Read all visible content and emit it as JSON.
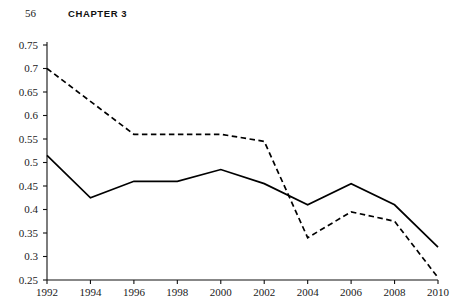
{
  "header": {
    "folio": "56",
    "chapter": "CHAPTER 3"
  },
  "figure": {
    "xaxis_title": "Year"
  },
  "chart_data": {
    "type": "line",
    "title": "",
    "subtitle": "",
    "xlabel": "Year",
    "ylabel": "",
    "x": [
      1992,
      1994,
      1996,
      1998,
      2000,
      2002,
      2004,
      2006,
      2008,
      2010
    ],
    "xtick_labels": [
      "1992",
      "1994",
      "1996",
      "1998",
      "2000",
      "2002",
      "2004",
      "2006",
      "2008",
      "2010"
    ],
    "xlim": [
      1992,
      2010
    ],
    "ylim": [
      0.25,
      0.75
    ],
    "ytick_labels": [
      "0.75",
      "0.7",
      "0.65",
      "0.6",
      "0.55",
      "0.5",
      "0.45",
      "0.4",
      "0.35",
      "0.3",
      "0.25"
    ],
    "ytick_values": [
      0.75,
      0.7,
      0.65,
      0.6,
      0.55,
      0.5,
      0.45,
      0.4,
      0.35,
      0.3,
      0.25
    ],
    "grid": false,
    "legend": "none",
    "series": [
      {
        "name": "solid-series",
        "style": "solid",
        "color": "#000000",
        "values": [
          0.515,
          0.425,
          0.46,
          0.46,
          0.485,
          0.455,
          0.41,
          0.455,
          0.41,
          0.32
        ]
      },
      {
        "name": "dashed-series",
        "style": "dashed",
        "color": "#000000",
        "values": [
          0.7,
          0.63,
          0.56,
          0.56,
          0.56,
          0.545,
          0.34,
          0.395,
          0.375,
          0.255
        ]
      }
    ],
    "annotations": []
  }
}
